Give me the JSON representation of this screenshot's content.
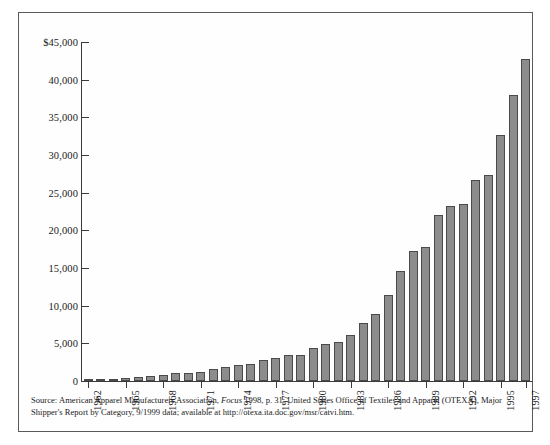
{
  "chart_data": {
    "type": "bar",
    "title": "",
    "subtitle": "",
    "xlabel": "",
    "ylabel": "",
    "ylim": [
      0,
      45000
    ],
    "grid": false,
    "legend": false,
    "y_ticks": [
      0,
      5000,
      10000,
      15000,
      20000,
      25000,
      30000,
      35000,
      40000,
      45000
    ],
    "y_tick_labels": [
      "0",
      "5,000",
      "10,000",
      "15,000",
      "20,000",
      "25,000",
      "30,000",
      "35,000",
      "40,000",
      "$45,000"
    ],
    "x_tick_labels": [
      "1962",
      "1965",
      "1968",
      "1971",
      "1974",
      "1977",
      "1980",
      "1983",
      "1986",
      "1989",
      "1992",
      "1995",
      "1997"
    ],
    "categories": [
      "1962",
      "1963",
      "1964",
      "1965",
      "1966",
      "1967",
      "1968",
      "1969",
      "1970",
      "1971",
      "1972",
      "1973",
      "1974",
      "1975",
      "1976",
      "1977",
      "1978",
      "1979",
      "1980",
      "1981",
      "1982",
      "1983",
      "1984",
      "1985",
      "1986",
      "1987",
      "1988",
      "1989",
      "1990",
      "1991",
      "1992",
      "1993",
      "1994",
      "1995",
      "1996",
      "1997"
    ],
    "values": [
      240,
      280,
      330,
      380,
      500,
      620,
      850,
      1000,
      1100,
      1250,
      1600,
      1900,
      2150,
      2200,
      2750,
      3050,
      3400,
      3500,
      4350,
      4900,
      5200,
      6050,
      7700,
      8950,
      11400,
      14600,
      17300,
      17800,
      22100,
      23200,
      23500,
      26700,
      27300,
      32700,
      38000,
      42800
    ]
  },
  "source": {
    "label": "Source:",
    "line1_a": " American Apparel Manufacturers Association, ",
    "line1_italic": "Focus",
    "line1_b": " 1998, p. 31; United States Office of Textiles and Apparel (OTEXA), Major",
    "line2": "Shipper's Report by Category, 9/1999 data; available at http://otexa.ita.doc.gov/msr/catvi.htm."
  },
  "style": {
    "bar_fill": "#8c8c8c",
    "bar_stroke": "#4a4a4a",
    "axis_color": "#3a3a3a",
    "frame_color": "#5a5a5a",
    "background": "#ffffff"
  }
}
